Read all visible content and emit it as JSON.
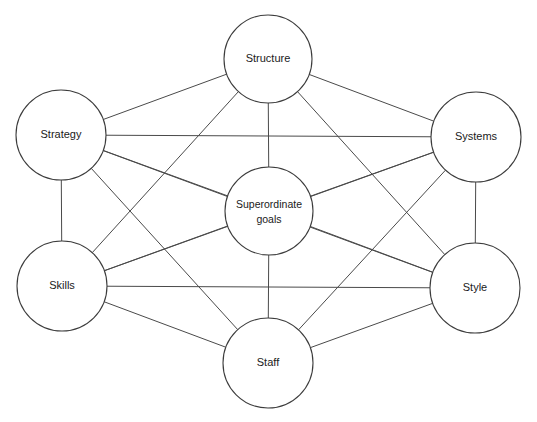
{
  "diagram": {
    "name": "McKinsey 7S Framework",
    "background_color": "#ffffff",
    "line_color": "#4a4a4a",
    "circle_stroke_color": "#3c3c3c",
    "text_color": "#1a1a1a",
    "nodes": [
      {
        "id": "structure",
        "label": "Structure",
        "label_line1": "Structure",
        "label_line2": "",
        "cx": 268,
        "cy": 59,
        "r": 44
      },
      {
        "id": "strategy",
        "label": "Strategy",
        "label_line1": "Strategy",
        "label_line2": "",
        "cx": 61,
        "cy": 135,
        "r": 45
      },
      {
        "id": "systems",
        "label": "Systems",
        "label_line1": "Systems",
        "label_line2": "",
        "cx": 476,
        "cy": 137,
        "r": 45
      },
      {
        "id": "superordinate_goals",
        "label": "Superordinate goals",
        "label_line1": "Superordinate",
        "label_line2": "goals",
        "cx": 269,
        "cy": 211,
        "r": 44
      },
      {
        "id": "skills",
        "label": "Skills",
        "label_line1": "Skills",
        "label_line2": "",
        "cx": 62,
        "cy": 286,
        "r": 45
      },
      {
        "id": "style",
        "label": "Style",
        "label_line1": "Style",
        "label_line2": "",
        "cx": 475,
        "cy": 288,
        "r": 45
      },
      {
        "id": "staff",
        "label": "Staff",
        "label_line1": "Staff",
        "label_line2": "",
        "cx": 268,
        "cy": 363,
        "r": 45
      }
    ],
    "edges": [
      {
        "from": "strategy",
        "to": "structure"
      },
      {
        "from": "structure",
        "to": "systems"
      },
      {
        "from": "strategy",
        "to": "systems"
      },
      {
        "from": "strategy",
        "to": "skills"
      },
      {
        "from": "systems",
        "to": "style"
      },
      {
        "from": "skills",
        "to": "style"
      },
      {
        "from": "skills",
        "to": "staff"
      },
      {
        "from": "staff",
        "to": "style"
      },
      {
        "from": "structure",
        "to": "superordinate_goals"
      },
      {
        "from": "strategy",
        "to": "superordinate_goals"
      },
      {
        "from": "systems",
        "to": "superordinate_goals"
      },
      {
        "from": "skills",
        "to": "superordinate_goals"
      },
      {
        "from": "style",
        "to": "superordinate_goals"
      },
      {
        "from": "staff",
        "to": "superordinate_goals"
      },
      {
        "from": "structure",
        "to": "skills"
      },
      {
        "from": "structure",
        "to": "style"
      },
      {
        "from": "staff",
        "to": "strategy"
      },
      {
        "from": "staff",
        "to": "systems"
      },
      {
        "from": "strategy",
        "to": "style"
      },
      {
        "from": "systems",
        "to": "skills"
      }
    ]
  }
}
